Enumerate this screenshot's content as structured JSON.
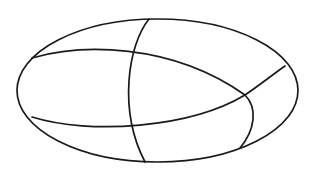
{
  "diagram": {
    "type": "line-drawing",
    "stroke_color": "#1a1a1a",
    "background": "#ffffff",
    "outer_ellipse": {
      "cx": 157.5,
      "cy": 90.5,
      "rx": 140.5,
      "ry": 71.5
    },
    "curves": [
      {
        "name": "upper-arc",
        "d": "M 32 58 C 80 44, 170 42, 245 95"
      },
      {
        "name": "right-lower-arc",
        "d": "M 245 95 C 258 108, 255 130, 240 148"
      },
      {
        "name": "lower-arc",
        "d": "M 32 117 C 90 135, 190 128, 245 95"
      },
      {
        "name": "right-spur",
        "d": "M 245 95 C 260 85, 272 75, 285 66"
      },
      {
        "name": "vertical-arc",
        "d": "M 149 19 C 128 45, 118 110, 145 162"
      }
    ]
  }
}
